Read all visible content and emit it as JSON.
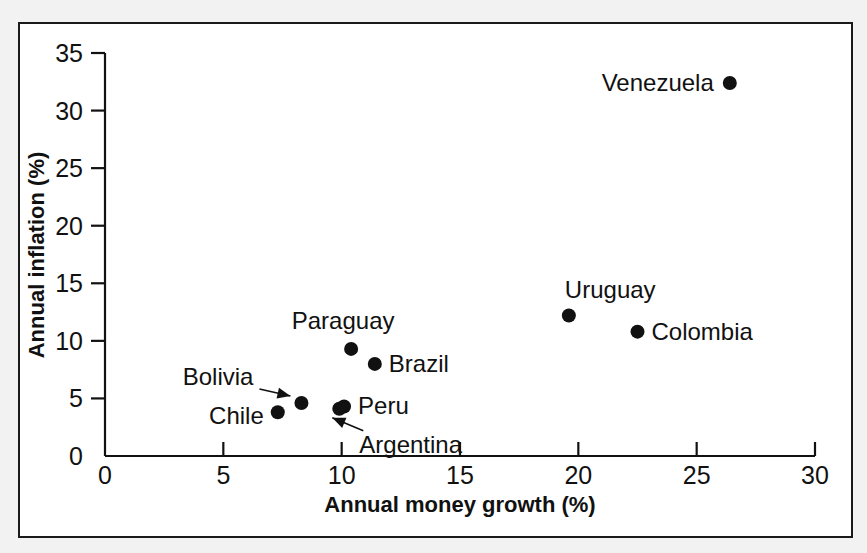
{
  "chart_data": {
    "type": "scatter",
    "title": "",
    "xlabel": "Annual money growth (%)",
    "ylabel": "Annual inflation (%)",
    "xlim": [
      0,
      30
    ],
    "ylim": [
      0,
      35
    ],
    "xticks": [
      "0",
      "5",
      "10",
      "15",
      "20",
      "25",
      "30"
    ],
    "yticks": [
      "0",
      "5",
      "10",
      "15",
      "20",
      "25",
      "30",
      "35"
    ],
    "grid": false,
    "legend": "none",
    "points": [
      {
        "label": "Venezuela",
        "x": 26.4,
        "y": 32.4,
        "label_side": "left",
        "leader": false
      },
      {
        "label": "Uruguay",
        "x": 19.6,
        "y": 12.2,
        "label_side": "above",
        "leader": false
      },
      {
        "label": "Colombia",
        "x": 22.5,
        "y": 10.8,
        "label_side": "right",
        "leader": false
      },
      {
        "label": "Paraguay",
        "x": 10.4,
        "y": 9.3,
        "label_side": "above",
        "leader": false
      },
      {
        "label": "Brazil",
        "x": 11.4,
        "y": 8.0,
        "label_side": "right",
        "leader": false
      },
      {
        "label": "Bolivia",
        "x": 8.3,
        "y": 4.6,
        "label_side": "left",
        "leader": true
      },
      {
        "label": "Chile",
        "x": 7.3,
        "y": 3.8,
        "label_side": "left",
        "leader": false
      },
      {
        "label": "Peru",
        "x": 10.1,
        "y": 4.3,
        "label_side": "right",
        "leader": false
      },
      {
        "label": "Argentina",
        "x": 9.9,
        "y": 4.1,
        "label_side": "below",
        "leader": true
      }
    ]
  },
  "figure": {
    "x_axis_title": "Annual money growth (%)",
    "y_axis_title": "Annual inflation (%)"
  }
}
